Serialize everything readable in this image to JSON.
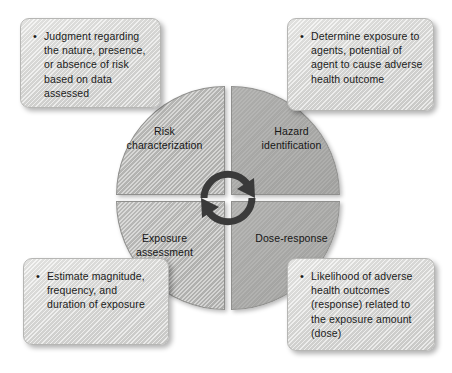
{
  "diagram": {
    "colors": {
      "background": "#ffffff",
      "quadrant_light": "#bdbdbb",
      "quadrant_dark": "#a9a9a7",
      "callout_fill": "#dcdcda",
      "outline": "#8f8f8d",
      "text": "#1b1b1b",
      "arrow": "#3a3a3a"
    },
    "quadrants": [
      {
        "id": "risk-characterization",
        "position": "top-left",
        "style": "hatched",
        "label_line1": "Risk",
        "label_line2": "characterization"
      },
      {
        "id": "hazard-identification",
        "position": "top-right",
        "style": "solid",
        "label_line1": "Hazard",
        "label_line2": "identification"
      },
      {
        "id": "exposure-assessment",
        "position": "bottom-left",
        "style": "hatched",
        "label_line1": "Exposure",
        "label_line2": "assessment"
      },
      {
        "id": "dose-response",
        "position": "bottom-right",
        "style": "solid",
        "label_line1": "Dose-response",
        "label_line2": ""
      }
    ],
    "center": {
      "icon": "circular-rotation-arrows",
      "arrow_count": 2,
      "direction": "clockwise"
    },
    "callouts": [
      {
        "id": "risk-characterization-callout",
        "position": "top-left",
        "bullets": [
          "Judgment regarding the nature, presence, or absence of risk based on data assessed"
        ]
      },
      {
        "id": "hazard-identification-callout",
        "position": "top-right",
        "bullets": [
          "Determine exposure to agents, potential of agent to cause adverse health outcome"
        ]
      },
      {
        "id": "exposure-assessment-callout",
        "position": "bottom-left",
        "bullets": [
          "Estimate magnitude, frequency, and duration of exposure"
        ]
      },
      {
        "id": "dose-response-callout",
        "position": "bottom-right",
        "bullets": [
          "Likelihood of adverse health outcomes (response) related to the exposure amount (dose)"
        ]
      }
    ]
  }
}
